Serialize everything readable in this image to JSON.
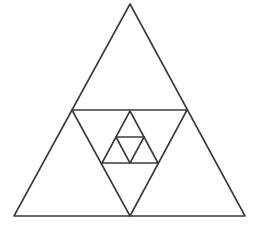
{
  "diagram": {
    "type": "nested-triangles",
    "stroke_color": "#3a3a3a",
    "background": "#ffffff",
    "shapes": [
      {
        "name": "outer-triangle",
        "points": [
          [
            130,
            4
          ],
          [
            14,
            216
          ],
          [
            245,
            216
          ]
        ]
      },
      {
        "name": "inverted-triangle-large",
        "points": [
          [
            72,
            110
          ],
          [
            187,
            110
          ],
          [
            130,
            216
          ]
        ]
      },
      {
        "name": "upright-triangle-middle",
        "points": [
          [
            130,
            111
          ],
          [
            102,
            163
          ],
          [
            158,
            163
          ]
        ]
      },
      {
        "name": "inverted-triangle-small",
        "points": [
          [
            116,
            137
          ],
          [
            144,
            137
          ],
          [
            130,
            163
          ]
        ]
      }
    ]
  }
}
